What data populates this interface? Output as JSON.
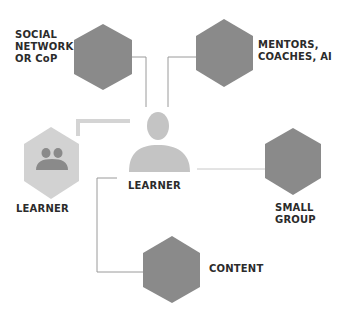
{
  "colors": {
    "hexagon_dark": "#8a8a8a",
    "hexagon_light": "#cfcfcf",
    "person_light": "#c4c4c4",
    "people_icon": "#8a8a8a",
    "connector": "#9a9a9a",
    "connector_light": "#d4d4d4",
    "label_text": "#2b2b2b"
  },
  "center": {
    "label": "LEARNER",
    "icon": "person-icon"
  },
  "nodes": [
    {
      "id": "social-network",
      "label": "SOCIAL\nNETWORK\nOR CoP"
    },
    {
      "id": "mentors",
      "label": "MENTORS,\nCOACHES, AI"
    },
    {
      "id": "small-group",
      "label": "SMALL\nGROUP"
    },
    {
      "id": "content",
      "label": "CONTENT"
    },
    {
      "id": "learner-peer",
      "label": "LEARNER",
      "icon": "people-icon"
    }
  ]
}
